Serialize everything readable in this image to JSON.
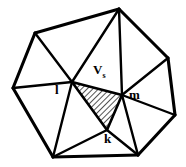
{
  "figure": {
    "type": "triangulated-polygon-mesh",
    "width": 186,
    "height": 167,
    "background_color": "#ffffff",
    "line_color": "#000000",
    "hatch_color": "#000000",
    "labels": [
      {
        "id": "l",
        "text": "l",
        "x": 55,
        "y": 83
      },
      {
        "id": "m",
        "text": "m",
        "x": 129,
        "y": 88
      },
      {
        "id": "k",
        "text": "k",
        "x": 104,
        "y": 132
      },
      {
        "id": "v",
        "text": "V",
        "subscript": "s",
        "x": 93,
        "y": 63
      }
    ],
    "vertices": {
      "top": {
        "x": 119,
        "y": 9
      },
      "upper_left": {
        "x": 35,
        "y": 33
      },
      "left": {
        "x": 13,
        "y": 88
      },
      "lower_left": {
        "x": 53,
        "y": 157
      },
      "bottom": {
        "x": 138,
        "y": 155
      },
      "lower_right": {
        "x": 175,
        "y": 115
      },
      "right": {
        "x": 168,
        "y": 58
      },
      "l": {
        "x": 72,
        "y": 82
      },
      "m": {
        "x": 122,
        "y": 95
      },
      "k": {
        "x": 107,
        "y": 130
      }
    },
    "shaded_triangle": {
      "label": "hatched-triangle-l-m-k",
      "vertex_ids": [
        "l",
        "m",
        "k"
      ],
      "fill_pattern": "diagonal-hatch",
      "hatch_angle_deg": 45,
      "hatch_spacing_px": 4
    },
    "edges": [
      {
        "from": "upper_left",
        "to": "top",
        "kind": "boundary"
      },
      {
        "from": "top",
        "to": "right",
        "kind": "boundary"
      },
      {
        "from": "right",
        "to": "lower_right",
        "kind": "boundary"
      },
      {
        "from": "lower_right",
        "to": "bottom",
        "kind": "boundary"
      },
      {
        "from": "bottom",
        "to": "lower_left",
        "kind": "boundary"
      },
      {
        "from": "lower_left",
        "to": "left",
        "kind": "boundary"
      },
      {
        "from": "left",
        "to": "upper_left",
        "kind": "boundary"
      },
      {
        "from": "upper_left",
        "to": "l",
        "kind": "interior"
      },
      {
        "from": "left",
        "to": "l",
        "kind": "interior"
      },
      {
        "from": "lower_left",
        "to": "l",
        "kind": "interior"
      },
      {
        "from": "top",
        "to": "l",
        "kind": "interior"
      },
      {
        "from": "top",
        "to": "m",
        "kind": "interior"
      },
      {
        "from": "right",
        "to": "m",
        "kind": "interior"
      },
      {
        "from": "lower_right",
        "to": "m",
        "kind": "interior"
      },
      {
        "from": "bottom",
        "to": "m",
        "kind": "interior"
      },
      {
        "from": "lower_left",
        "to": "k",
        "kind": "interior"
      },
      {
        "from": "bottom",
        "to": "k",
        "kind": "interior"
      },
      {
        "from": "l",
        "to": "m",
        "kind": "shaded-edge"
      },
      {
        "from": "m",
        "to": "k",
        "kind": "shaded-edge"
      },
      {
        "from": "k",
        "to": "l",
        "kind": "shaded-edge"
      }
    ]
  }
}
